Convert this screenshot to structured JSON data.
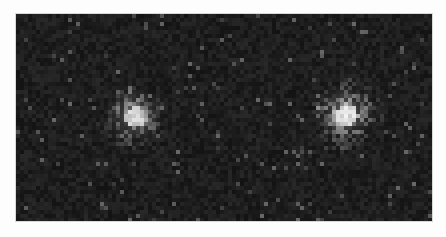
{
  "image": {
    "description": "Grayscale noisy microscopy-style image with two bright diffuse spots",
    "background_color": "#fdfdfd",
    "frame": {
      "x": 16,
      "y": 14,
      "width": 416,
      "height": 207,
      "base_color": "#1f1f1f"
    },
    "noise": {
      "cell_size": 4,
      "base_gray": 30,
      "variation": 22,
      "speckle_probability": 0.03,
      "speckle_gray": 95
    },
    "spots": [
      {
        "name": "left-spot",
        "cx": 117,
        "cy": 101,
        "core_radius": 10,
        "halo_radius": 48,
        "peak_gray": 215
      },
      {
        "name": "right-spot",
        "cx": 329,
        "cy": 99,
        "core_radius": 11,
        "halo_radius": 52,
        "peak_gray": 240
      }
    ]
  }
}
